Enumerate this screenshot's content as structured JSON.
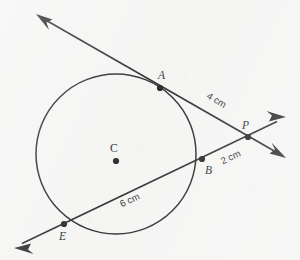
{
  "figure": {
    "type": "geometry-diagram",
    "background_color": "#f5f5f4",
    "ink_color": "#18181a"
  },
  "circle": {
    "name": "circle-C",
    "center_label": "C",
    "center": {
      "x": 116,
      "y": 154
    },
    "center_dot": {
      "x": 116,
      "y": 161
    },
    "center_label_pos": {
      "x": 110,
      "y": 152
    },
    "radius": 80
  },
  "points": [
    {
      "id": "A",
      "label": "A",
      "x": 160,
      "y": 88,
      "label_x": 158,
      "label_y": 79,
      "on": "circle-tangent-point"
    },
    {
      "id": "P",
      "label": "P",
      "x": 248,
      "y": 137,
      "label_x": 242,
      "label_y": 129,
      "on": "external-intersection"
    },
    {
      "id": "B",
      "label": "B",
      "x": 202,
      "y": 159,
      "label_x": 205,
      "label_y": 174,
      "on": "circle-secant-near"
    },
    {
      "id": "E",
      "label": "E",
      "x": 64,
      "y": 224,
      "label_x": 59,
      "label_y": 240,
      "on": "circle-secant-far"
    }
  ],
  "lines": [
    {
      "id": "tangent-line",
      "name": "tangent-line-AP",
      "from": {
        "x": 37,
        "y": 15
      },
      "to": {
        "x": 285,
        "y": 157
      },
      "arrows": [
        "start",
        "end"
      ],
      "through": [
        "A",
        "P"
      ]
    },
    {
      "id": "secant-line",
      "name": "secant-line-EBP",
      "from": {
        "x": 15,
        "y": 247
      },
      "to": {
        "x": 285,
        "y": 118
      },
      "arrows": [
        "start",
        "end"
      ],
      "through": [
        "E",
        "B",
        "P"
      ]
    }
  ],
  "measurements": [
    {
      "id": "AP",
      "text": "4 cm",
      "x": 215,
      "y": 103,
      "rotation": 30,
      "segment": "A to P"
    },
    {
      "id": "BP",
      "text": "2 cm",
      "x": 232,
      "y": 160,
      "rotation": -26,
      "segment": "B to P"
    },
    {
      "id": "EB",
      "text": "6 cm",
      "x": 131,
      "y": 203,
      "rotation": -25,
      "segment": "E to B"
    }
  ]
}
